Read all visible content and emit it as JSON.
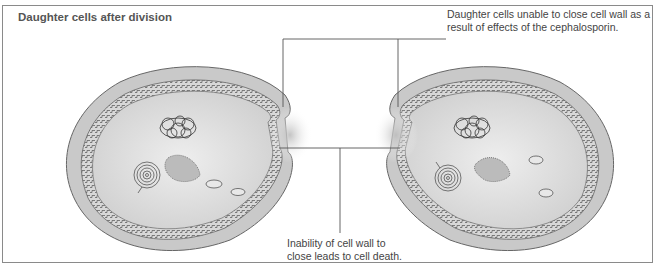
{
  "figure": {
    "title": "Daughter cells after division",
    "annotations": [
      {
        "id": "unable-to-close",
        "text": "Daughter cells unable to close cell wall as a result of effects of the cephalosporin."
      },
      {
        "id": "cell-death",
        "text": "Inability of cell wall to close leads to cell death."
      }
    ],
    "colors": {
      "frame": "#8a8a8a",
      "cytoplasm": "#dcdcdc",
      "wall": "#c9c9c9",
      "line": "#555555",
      "text": "#444444"
    }
  }
}
